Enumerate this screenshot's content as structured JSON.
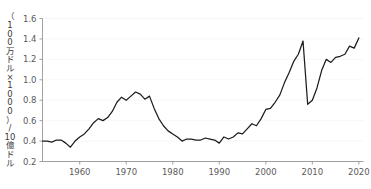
{
  "chart_data": {
    "type": "line",
    "title": "",
    "subtitle": "",
    "xlabel": "",
    "ylabel": "（100万ドル×1000）/10億ドル",
    "ylabel_chars": [
      "（",
      "1",
      "0",
      "0",
      "万",
      "ド",
      "ル",
      "×",
      "1",
      "0",
      "0",
      "0",
      "）",
      "/",
      "10",
      "億",
      "ド",
      "ル"
    ],
    "xlim": [
      1952,
      2021
    ],
    "ylim": [
      0.2,
      1.6
    ],
    "xticks": [
      1960,
      1970,
      1980,
      1990,
      2000,
      2010,
      2020
    ],
    "xtick_labels": [
      "1960",
      "1970",
      "1980",
      "1990",
      "2000",
      "2010",
      "2020"
    ],
    "yticks": [
      0.2,
      0.4,
      0.6,
      0.8,
      1.0,
      1.2,
      1.4,
      1.6
    ],
    "ytick_labels": [
      "0.2",
      "0.4",
      "0.6",
      "0.8",
      "1.0",
      "1.2",
      "1.4",
      "1.6"
    ],
    "grid": true,
    "grid_axis": "y",
    "legend": false,
    "legend_position": "none",
    "line_color": "#1c1c1c",
    "grid_color": "#f2f2f2",
    "axis_color": "#8a8a8a",
    "background_color": "#ffffff",
    "series": [
      {
        "name": "series-1",
        "x": [
          1952,
          1953,
          1954,
          1955,
          1956,
          1957,
          1958,
          1959,
          1960,
          1961,
          1962,
          1963,
          1964,
          1965,
          1966,
          1967,
          1968,
          1969,
          1970,
          1971,
          1972,
          1973,
          1974,
          1975,
          1976,
          1977,
          1978,
          1979,
          1980,
          1981,
          1982,
          1983,
          1984,
          1985,
          1986,
          1987,
          1988,
          1989,
          1990,
          1991,
          1992,
          1993,
          1994,
          1995,
          1996,
          1997,
          1998,
          1999,
          2000,
          2001,
          2002,
          2003,
          2004,
          2005,
          2006,
          2007,
          2008,
          2009,
          2010,
          2011,
          2012,
          2013,
          2014,
          2015,
          2016,
          2017,
          2018,
          2019,
          2020
        ],
        "values": [
          0.4,
          0.4,
          0.39,
          0.41,
          0.41,
          0.38,
          0.34,
          0.4,
          0.44,
          0.47,
          0.52,
          0.58,
          0.62,
          0.6,
          0.63,
          0.69,
          0.78,
          0.83,
          0.8,
          0.84,
          0.88,
          0.86,
          0.81,
          0.84,
          0.72,
          0.62,
          0.55,
          0.5,
          0.47,
          0.44,
          0.4,
          0.42,
          0.42,
          0.41,
          0.41,
          0.43,
          0.42,
          0.41,
          0.38,
          0.44,
          0.42,
          0.44,
          0.48,
          0.47,
          0.52,
          0.57,
          0.55,
          0.62,
          0.71,
          0.72,
          0.78,
          0.85,
          0.97,
          1.07,
          1.18,
          1.25,
          1.38,
          1.44,
          1.47,
          1.41,
          1.13,
          0.92,
          0.9,
          0.95,
          0.93,
          0.91,
          0.92,
          0.88,
          0.76
        ]
      }
    ],
    "extra_points": [
      {
        "x": 2011,
        "y": 1.47
      },
      {
        "x": 2013,
        "y": 0.76
      }
    ]
  },
  "chart_series_tail": {
    "x": [
      2009,
      2010,
      2011,
      2012,
      2013,
      2014,
      2015,
      2016,
      2017,
      2018,
      2019,
      2020
    ],
    "values": [
      0.76,
      0.8,
      0.92,
      1.09,
      1.2,
      1.17,
      1.22,
      1.23,
      1.25,
      1.33,
      1.31,
      1.41
    ]
  }
}
